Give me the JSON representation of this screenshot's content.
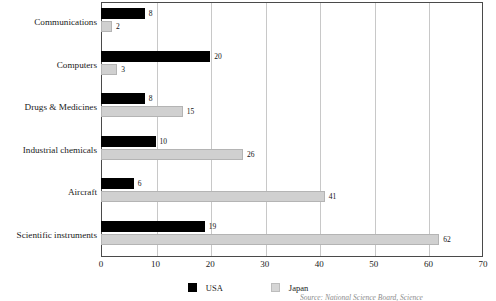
{
  "chart_data": {
    "type": "bar",
    "orientation": "horizontal",
    "title": "",
    "xlabel": "",
    "ylabel": "",
    "categories": [
      "Communications",
      "Computers",
      "Drugs & Medicines",
      "Industrial chemicals",
      "Aircraft",
      "Scientific instruments"
    ],
    "series": [
      {
        "name": "USA",
        "color": "#000000",
        "values": [
          8,
          20,
          8,
          10,
          6,
          19
        ]
      },
      {
        "name": "Japan",
        "color": "#d0d0d0",
        "values": [
          2,
          3,
          15,
          26,
          41,
          62
        ]
      }
    ],
    "xlim": [
      0,
      70
    ],
    "xticks": [
      0,
      10,
      20,
      30,
      40,
      50,
      60,
      70
    ],
    "xtick_labels": [
      "0",
      "10",
      "20",
      "30",
      "40",
      "50",
      "60",
      "70"
    ],
    "grid": true,
    "grid_axis": "x",
    "legend_position": "bottom-center",
    "data_labels": true
  },
  "legend": {
    "items": [
      {
        "label": "USA"
      },
      {
        "label": "Japan"
      }
    ]
  },
  "footer": {
    "source": "Source: National Science Board, Science"
  }
}
